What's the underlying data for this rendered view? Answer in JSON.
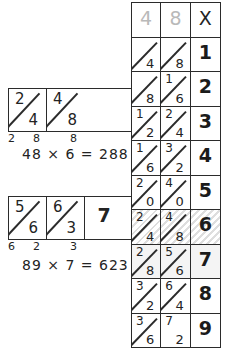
{
  "examples": [
    {
      "id": "example-1",
      "name": "lattice-example-48x6",
      "cells": [
        {
          "top": "2",
          "bottom": "4",
          "diagonal": true
        },
        {
          "top": "4",
          "bottom": "8",
          "diagonal": true
        }
      ],
      "legs": [
        "2",
        "8",
        "8"
      ],
      "equation": "48 × 6 = 288"
    },
    {
      "id": "example-2",
      "name": "lattice-example-89x7",
      "cells": [
        {
          "top": "5",
          "bottom": "6",
          "diagonal": true
        },
        {
          "top": "6",
          "bottom": "3",
          "diagonal": true
        },
        {
          "single": "7",
          "diagonal": false
        }
      ],
      "legs": [
        "6",
        "2",
        "3"
      ],
      "equation": "89 × 7 = 623"
    }
  ],
  "times_table": {
    "name": "times-table-48",
    "header": {
      "tens": "4",
      "ones": "8",
      "multiplier_symbol": "X"
    },
    "rows": [
      {
        "multiplier": "1",
        "tens": {
          "top": "",
          "bottom": "4",
          "diagonal": true
        },
        "ones": {
          "top": "",
          "bottom": "8",
          "diagonal": true
        },
        "style": "normal"
      },
      {
        "multiplier": "2",
        "tens": {
          "top": "",
          "bottom": "8",
          "diagonal": true
        },
        "ones": {
          "top": "1",
          "bottom": "6",
          "diagonal": true
        },
        "style": "normal"
      },
      {
        "multiplier": "3",
        "tens": {
          "top": "1",
          "bottom": "2",
          "diagonal": true
        },
        "ones": {
          "top": "2",
          "bottom": "4",
          "diagonal": true
        },
        "style": "normal"
      },
      {
        "multiplier": "4",
        "tens": {
          "top": "1",
          "bottom": "6",
          "diagonal": true
        },
        "ones": {
          "top": "3",
          "bottom": "2",
          "diagonal": true
        },
        "style": "normal"
      },
      {
        "multiplier": "5",
        "tens": {
          "top": "2",
          "bottom": "0",
          "diagonal": true
        },
        "ones": {
          "top": "4",
          "bottom": "0",
          "diagonal": true
        },
        "style": "normal"
      },
      {
        "multiplier": "6",
        "tens": {
          "top": "2",
          "bottom": "4",
          "diagonal": true
        },
        "ones": {
          "top": "4",
          "bottom": "8",
          "diagonal": true
        },
        "style": "highlight"
      },
      {
        "multiplier": "7",
        "tens": {
          "top": "2",
          "bottom": "8",
          "diagonal": true
        },
        "ones": {
          "top": "5",
          "bottom": "6",
          "diagonal": true
        },
        "style": "dim"
      },
      {
        "multiplier": "8",
        "tens": {
          "top": "3",
          "bottom": "2",
          "diagonal": true
        },
        "ones": {
          "top": "6",
          "bottom": "4",
          "diagonal": true
        },
        "style": "normal"
      },
      {
        "multiplier": "9",
        "tens": {
          "top": "3",
          "bottom": "6",
          "diagonal": true
        },
        "ones": {
          "top": "7",
          "bottom": "2",
          "diagonal": false
        },
        "style": "normal"
      }
    ]
  },
  "colors": {
    "ink": "#232323",
    "faint_ink": "#b9b9b9",
    "paper": "#ffffff",
    "highlight_hatch": "rgba(0,0,0,0.13)"
  }
}
